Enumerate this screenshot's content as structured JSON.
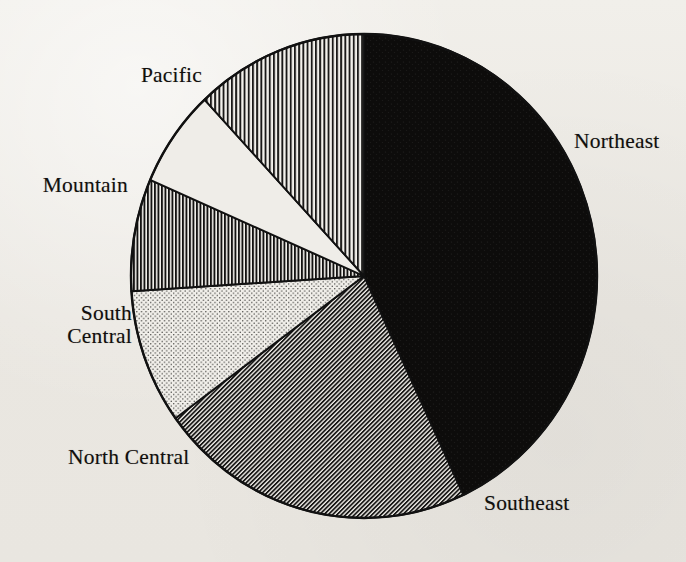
{
  "figure": {
    "title": "",
    "background_color": "#eeece7",
    "ink_color": "#111111"
  },
  "chart_data": {
    "type": "pie",
    "title": "",
    "xlabel": "",
    "ylabel": "",
    "legend_position": "none",
    "grid": false,
    "start_angle_deg": 90,
    "direction": "clockwise",
    "center": {
      "x": 364,
      "y": 276
    },
    "radius": {
      "x": 233,
      "y": 242
    },
    "categories": [
      "Northeast",
      "Southeast",
      "North Central",
      "South Central",
      "Mountain",
      "Pacific"
    ],
    "values": [
      43.0,
      22.0,
      9.0,
      7.5,
      6.5,
      12.0
    ],
    "slices": [
      {
        "label": "Northeast",
        "value": 43.0,
        "start_deg": 0,
        "end_deg": 154.8,
        "fill": "solid-black",
        "fill_color": "#0d0c0b",
        "label_side": "right",
        "label_x": 574,
        "label_y": 130
      },
      {
        "label": "Southeast",
        "value": 22.0,
        "start_deg": 154.8,
        "end_deg": 234.0,
        "fill": "diagonal-hatch-dense",
        "fill_color": "#4a4a4a",
        "label_side": "right",
        "label_x": 484,
        "label_y": 492
      },
      {
        "label": "North Central",
        "value": 9.0,
        "start_deg": 234.0,
        "end_deg": 266.4,
        "fill": "stipple-dots",
        "fill_color": "#d8d6d1",
        "label_side": "left",
        "label_x": 68,
        "label_y": 446
      },
      {
        "label": "South Central",
        "value": 7.5,
        "start_deg": 266.4,
        "end_deg": 293.4,
        "fill": "vertical-stripes-dense",
        "fill_color": "#3a3a3a",
        "label_side": "left",
        "label_x": 0,
        "label_y": 302
      },
      {
        "label": "Mountain",
        "value": 6.5,
        "start_deg": 293.4,
        "end_deg": 316.8,
        "fill": "none-white",
        "fill_color": "#efedE8",
        "label_side": "left",
        "label_x": 0,
        "label_y": 174
      },
      {
        "label": "Pacific",
        "value": 12.0,
        "start_deg": 316.8,
        "end_deg": 360.0,
        "fill": "vertical-stripes",
        "fill_color": "#8a8a8a",
        "label_side": "left",
        "label_x": 0,
        "label_y": 64
      }
    ]
  },
  "labels": {
    "northeast": "Northeast",
    "southeast": "Southeast",
    "north_central": "North Central",
    "south_central": "South\nCentral",
    "mountain": "Mountain",
    "pacific": "Pacific"
  }
}
